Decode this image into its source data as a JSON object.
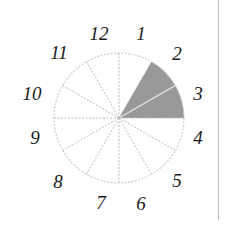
{
  "diagram": {
    "type": "fraction-circle",
    "total_sectors": 12,
    "shaded_sectors": 2,
    "shaded_between_labels": [
      "2",
      "4"
    ],
    "center": [
      119,
      118
    ],
    "radius": 65,
    "colors": {
      "shade": "#999999",
      "outline": "#cccccc",
      "divider": "#bbbbbb",
      "label": "#1a1a1a"
    },
    "labels": [
      {
        "text": "12",
        "x": 99,
        "y": 33
      },
      {
        "text": "1",
        "x": 141,
        "y": 33
      },
      {
        "text": "2",
        "x": 177,
        "y": 53
      },
      {
        "text": "3",
        "x": 198,
        "y": 93
      },
      {
        "text": "4",
        "x": 198,
        "y": 137
      },
      {
        "text": "5",
        "x": 177,
        "y": 180
      },
      {
        "text": "6",
        "x": 141,
        "y": 203
      },
      {
        "text": "7",
        "x": 101,
        "y": 202
      },
      {
        "text": "8",
        "x": 58,
        "y": 181
      },
      {
        "text": "9",
        "x": 35,
        "y": 137
      },
      {
        "text": "10",
        "x": 32,
        "y": 93
      },
      {
        "text": "11",
        "x": 59,
        "y": 52
      }
    ]
  }
}
